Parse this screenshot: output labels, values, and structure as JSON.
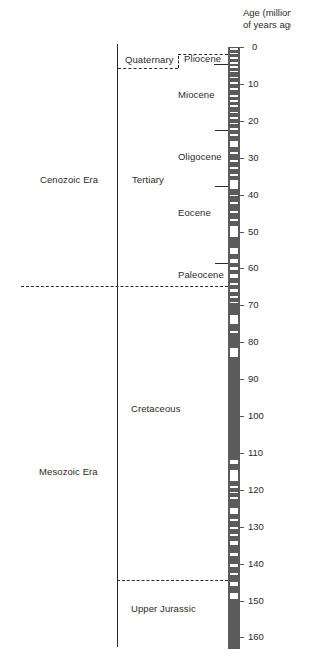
{
  "axis": {
    "title_line1": "Age (millions",
    "title_line2": "of years ago)",
    "ticks": [
      "0",
      "10",
      "20",
      "30",
      "40",
      "50",
      "60",
      "70",
      "80",
      "90",
      "100",
      "110",
      "120",
      "130",
      "140",
      "150",
      "160"
    ]
  },
  "eras": {
    "cenozoic": "Cenozoic Era",
    "mesozoic": "Mesozoic Era"
  },
  "periods": {
    "quaternary": "Quaternary",
    "tertiary": "Tertiary",
    "cretaceous": "Cretaceous",
    "upper_jurassic": "Upper Jurassic"
  },
  "epochs": {
    "pliocene": "Pliocene",
    "miocene": "Miocene",
    "oligocene": "Oligocene",
    "eocene": "Eocene",
    "paleocene": "Paleocene"
  },
  "colors": {
    "ink": "#2a2a2a",
    "reversed_polarity": "#5b5b5b",
    "normal_polarity": "#ffffff"
  },
  "chart_data": {
    "type": "geologic-timescale",
    "ylabel": "Age (millions of years ago)",
    "ylim": [
      0,
      163
    ],
    "ticks": [
      0,
      10,
      20,
      30,
      40,
      50,
      60,
      70,
      80,
      90,
      100,
      110,
      120,
      130,
      140,
      150,
      160
    ],
    "eras": [
      {
        "name": "Cenozoic Era",
        "from": 0,
        "to": 65
      },
      {
        "name": "Mesozoic Era",
        "from": 65,
        "to": 163
      }
    ],
    "periods": [
      {
        "name": "Quaternary",
        "from": 0,
        "to": 2
      },
      {
        "name": "Tertiary",
        "from": 2,
        "to": 65
      },
      {
        "name": "Cretaceous",
        "from": 65,
        "to": 144
      },
      {
        "name": "Upper Jurassic",
        "from": 144,
        "to": 163
      }
    ],
    "epochs": [
      {
        "name": "Pliocene",
        "from": 2,
        "to": 5
      },
      {
        "name": "Miocene",
        "from": 5,
        "to": 23
      },
      {
        "name": "Oligocene",
        "from": 23,
        "to": 37
      },
      {
        "name": "Eocene",
        "from": 37,
        "to": 57
      },
      {
        "name": "Paleocene",
        "from": 57,
        "to": 65
      }
    ],
    "normal_polarity_bands_ma": [
      [
        0.2,
        0.7
      ],
      [
        1.6,
        2.0
      ],
      [
        2.6,
        3.2
      ],
      [
        4.0,
        4.6
      ],
      [
        5.2,
        5.6
      ],
      [
        6.4,
        6.8
      ],
      [
        8.0,
        8.5
      ],
      [
        9.4,
        9.9
      ],
      [
        11.0,
        11.6
      ],
      [
        13.0,
        13.5
      ],
      [
        14.4,
        14.8
      ],
      [
        15.6,
        16.2
      ],
      [
        17.5,
        18.0
      ],
      [
        19.0,
        19.6
      ],
      [
        20.6,
        21.0
      ],
      [
        22.0,
        22.4
      ],
      [
        23.5,
        24.0
      ],
      [
        25.5,
        27.0
      ],
      [
        28.5,
        29.0
      ],
      [
        30.5,
        31.2
      ],
      [
        32.5,
        33.0
      ],
      [
        34.5,
        35.0
      ],
      [
        36.0,
        38.5
      ],
      [
        40.0,
        40.5
      ],
      [
        42.0,
        42.5
      ],
      [
        44.5,
        45.0
      ],
      [
        46.5,
        47.2
      ],
      [
        48.5,
        51.5
      ],
      [
        54.5,
        56.0
      ],
      [
        57.5,
        58.5
      ],
      [
        59.5,
        60.5
      ],
      [
        61.5,
        62.5
      ],
      [
        64.0,
        64.5
      ],
      [
        65.5,
        66.5
      ],
      [
        67.5,
        68.0
      ],
      [
        69.0,
        69.5
      ],
      [
        72.5,
        75.0
      ],
      [
        77.0,
        77.5
      ],
      [
        81.5,
        84.0
      ],
      [
        112.0,
        113.0
      ],
      [
        114.5,
        117.5
      ],
      [
        119.0,
        119.5
      ],
      [
        120.5,
        121.0
      ],
      [
        122.0,
        122.5
      ],
      [
        125.0,
        126.5
      ],
      [
        128.0,
        128.5
      ],
      [
        130.0,
        130.5
      ],
      [
        132.0,
        132.5
      ],
      [
        134.0,
        135.0
      ],
      [
        137.0,
        138.0
      ],
      [
        140.0,
        141.0
      ],
      [
        142.5,
        143.0
      ],
      [
        145.0,
        146.0
      ],
      [
        148.0,
        149.5
      ]
    ]
  }
}
